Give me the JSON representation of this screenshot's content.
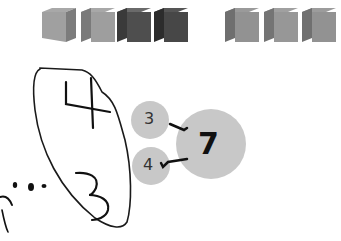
{
  "cubes": {
    "group1": [
      {
        "shade": "light",
        "colors": {
          "top": "#a8a8a8",
          "front": "#a0a0a0",
          "side": "#7c7c7c"
        }
      },
      {
        "shade": "light",
        "colors": {
          "top": "#a8a8a8",
          "front": "#9e9e9e",
          "side": "#7a7a7a"
        }
      },
      {
        "shade": "dark",
        "colors": {
          "top": "#6a6a6a",
          "front": "#4e4e4e",
          "side": "#3a3a3a"
        }
      },
      {
        "shade": "dark",
        "colors": {
          "top": "#555555",
          "front": "#474747",
          "side": "#2c2c2c"
        }
      }
    ],
    "group2": [
      {
        "shade": "medium",
        "colors": {
          "top": "#9a9a9a",
          "front": "#929292",
          "side": "#6f6f6f"
        }
      },
      {
        "shade": "medium",
        "colors": {
          "top": "#a0a0a0",
          "front": "#979797",
          "side": "#747474"
        }
      },
      {
        "shade": "medium",
        "colors": {
          "top": "#9c9c9c",
          "front": "#929292",
          "side": "#707070"
        }
      }
    ]
  },
  "handwriting": {
    "oval_top_number": "4",
    "oval_bottom_number": "3"
  },
  "number_bond": {
    "part1": "3",
    "part2": "4",
    "whole": "7",
    "circle_color": "#c8c8c8"
  }
}
